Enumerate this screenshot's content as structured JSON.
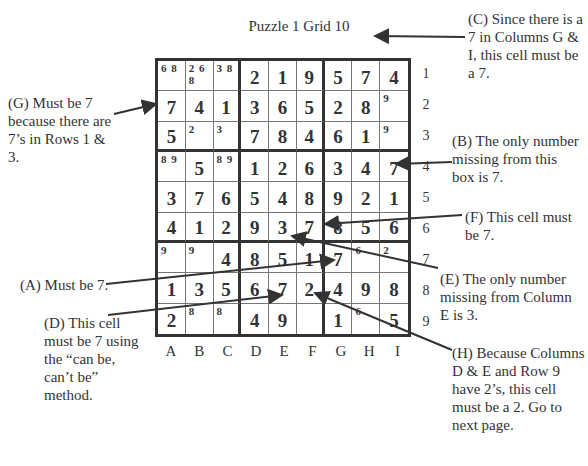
{
  "title": "Puzzle 1  Grid 10",
  "column_labels": [
    "A",
    "B",
    "C",
    "D",
    "E",
    "F",
    "G",
    "H",
    "I"
  ],
  "row_labels": [
    "1",
    "2",
    "3",
    "4",
    "5",
    "6",
    "7",
    "8",
    "9"
  ],
  "grid": [
    [
      {
        "c": "6 8"
      },
      {
        "c": "2 6\n8"
      },
      {
        "c": "3 8"
      },
      {
        "v": "2"
      },
      {
        "v": "1"
      },
      {
        "v": "9"
      },
      {
        "v": "5"
      },
      {
        "v": "7"
      },
      {
        "v": "4"
      }
    ],
    [
      {
        "v": "7"
      },
      {
        "v": "4"
      },
      {
        "v": "1"
      },
      {
        "v": "3"
      },
      {
        "v": "6"
      },
      {
        "v": "5"
      },
      {
        "v": "2"
      },
      {
        "v": "8"
      },
      {
        "c": "9"
      }
    ],
    [
      {
        "v": "5"
      },
      {
        "c": "2"
      },
      {
        "c": "3"
      },
      {
        "v": "7"
      },
      {
        "v": "8"
      },
      {
        "v": "4"
      },
      {
        "v": "6"
      },
      {
        "v": "1"
      },
      {
        "c": "9"
      }
    ],
    [
      {
        "c": "8 9"
      },
      {
        "v": "5"
      },
      {
        "c": "8 9"
      },
      {
        "v": "1"
      },
      {
        "v": "2"
      },
      {
        "v": "6"
      },
      {
        "v": "3"
      },
      {
        "v": "4"
      },
      {
        "v": "7"
      }
    ],
    [
      {
        "v": "3"
      },
      {
        "v": "7"
      },
      {
        "v": "6"
      },
      {
        "v": "5"
      },
      {
        "v": "4"
      },
      {
        "v": "8"
      },
      {
        "v": "9"
      },
      {
        "v": "2"
      },
      {
        "v": "1"
      }
    ],
    [
      {
        "v": "4"
      },
      {
        "v": "1"
      },
      {
        "v": "2"
      },
      {
        "v": "9"
      },
      {
        "v": "3"
      },
      {
        "v": "7"
      },
      {
        "v": "8"
      },
      {
        "v": "5"
      },
      {
        "v": "6"
      }
    ],
    [
      {
        "c": "9"
      },
      {
        "c": "9"
      },
      {
        "v": "4"
      },
      {
        "v": "8"
      },
      {
        "v": "5"
      },
      {
        "v": "1"
      },
      {
        "v": "7"
      },
      {
        "c": "6"
      },
      {
        "c": "2"
      }
    ],
    [
      {
        "v": "1"
      },
      {
        "v": "3"
      },
      {
        "v": "5"
      },
      {
        "v": "6"
      },
      {
        "v": "7"
      },
      {
        "v": "2"
      },
      {
        "v": "4"
      },
      {
        "v": "9"
      },
      {
        "v": "8"
      }
    ],
    [
      {
        "v": "2"
      },
      {
        "c": "8"
      },
      {
        "c": "8"
      },
      {
        "v": "4"
      },
      {
        "v": "9"
      },
      {},
      {
        "v": "1"
      },
      {
        "c": "6"
      },
      {
        "v": "5"
      }
    ]
  ],
  "notes": {
    "A": "(A) Must be 7.",
    "B": "(B) The only number missing from this box is 7.",
    "C": "(C) Since there is a 7 in Columns G & I, this cell must be a 7.",
    "D": "(D) This cell must be 7 using the “can be, can’t be” method.",
    "E": "(E) The only number missing from Column E is 3.",
    "F": "(F) This cell must be 7.",
    "G": "(G) Must be 7 because there are 7’s in Rows 1 & 3.",
    "H": "(H) Because Columns D & E and Row 9 have 2’s, this cell must be a 2. Go to next page."
  },
  "colors": {
    "ink": "#333333",
    "background": "#ffffff",
    "grid_line": "#777777"
  }
}
